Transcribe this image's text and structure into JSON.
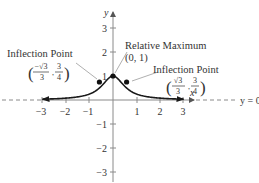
{
  "chart_data": {
    "type": "line",
    "title": "",
    "function": "y = 1 / (3x^2 + 1)",
    "xlabel": "x",
    "ylabel": "y",
    "xlim": [
      -3.4,
      3.4
    ],
    "ylim": [
      -3.4,
      3.7
    ],
    "grid": false,
    "x_ticks": [
      "-3",
      "-2",
      "-1",
      "1",
      "2",
      "3"
    ],
    "y_ticks": [
      "3",
      "2",
      "1",
      "-1",
      "-2",
      "-3"
    ],
    "x": [
      -3,
      -2.5,
      -2,
      -1.5,
      -1,
      -0.75,
      -0.577,
      -0.4,
      -0.2,
      0,
      0.2,
      0.4,
      0.577,
      0.75,
      1,
      1.5,
      2,
      2.5,
      3
    ],
    "y": [
      0.036,
      0.051,
      0.077,
      0.129,
      0.25,
      0.372,
      0.75,
      0.676,
      0.893,
      1,
      0.893,
      0.676,
      0.75,
      0.372,
      0.25,
      0.129,
      0.077,
      0.051,
      0.036
    ],
    "asymptote": {
      "label": "y = 0",
      "value": 0,
      "style": "dashed"
    },
    "points": [
      {
        "name": "inflection-left",
        "x": -0.577,
        "y": 0.75
      },
      {
        "name": "relative-maximum",
        "x": 0,
        "y": 1
      },
      {
        "name": "inflection-right",
        "x": 0.577,
        "y": 0.75
      }
    ],
    "annotations": [
      {
        "text": "Inflection Point",
        "coords": "(-√3/3, 3/4)"
      },
      {
        "text": "Relative Maximum",
        "coords": "(0, 1)"
      },
      {
        "text": "Inflection Point",
        "coords": "(√3/3, 3/4)"
      }
    ]
  },
  "labels": {
    "x_axis": "x",
    "y_axis": "y",
    "asymptote": "y = 0",
    "ticks_x": {
      "n3": "−3",
      "n2": "−2",
      "n1": "−1",
      "p1": "1",
      "p2": "2",
      "p3": "3"
    },
    "ticks_y": {
      "p3": "3",
      "p2": "2",
      "p1": "1",
      "n1": "−1",
      "n2": "−2",
      "n3": "−3"
    },
    "left_inflection": {
      "title": "Inflection Point",
      "num_x": "−√3",
      "den_x": "3",
      "num_y": "3",
      "den_y": "4",
      "sep": ","
    },
    "max": {
      "title": "Relative Maximum",
      "coords": "(0, 1)"
    },
    "right_inflection": {
      "title": "Inflection Point",
      "num_x": "√3",
      "den_x": "3",
      "num_y": "3",
      "den_y": "4",
      "sep": ","
    }
  },
  "colors": {
    "axis": "#8a8a8a",
    "curve": "#1a1a1a",
    "text": "#333333",
    "leader": "#9a9a9a"
  }
}
